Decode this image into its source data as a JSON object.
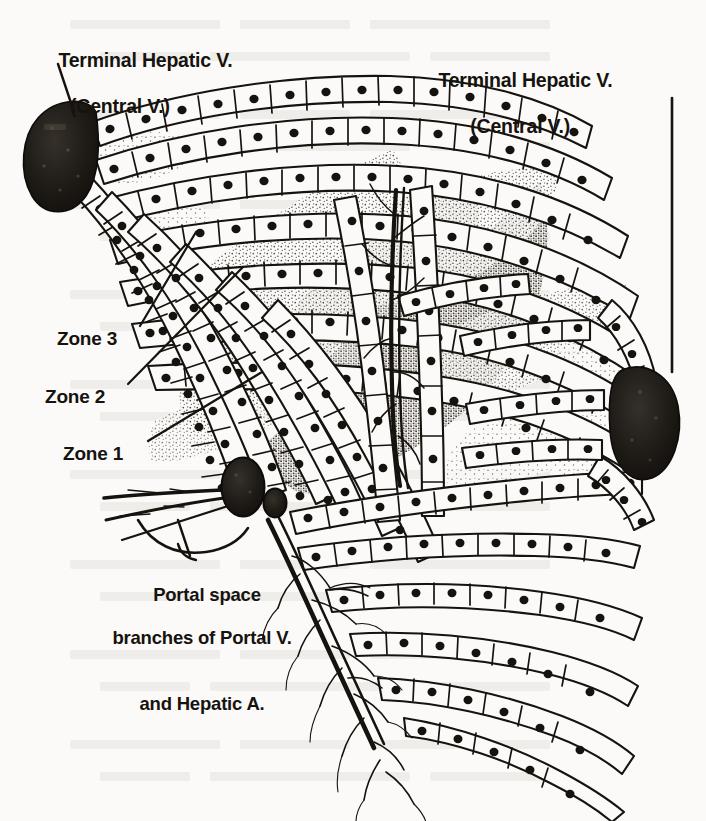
{
  "figure": {
    "type": "anatomical-line-diagram",
    "background_color": "#fbfaf8",
    "ink_color": "#16130f",
    "vessel_fill_color": "#1a1713",
    "stipple_color": "#3a332c"
  },
  "labels": {
    "terminal_hepatic_vein_left": {
      "line1": "Terminal Hepatic V.",
      "line2": "(Central V.)"
    },
    "terminal_hepatic_vein_right": {
      "line1": "Terminal Hepatic V.",
      "line2": "(Central V.)"
    },
    "zone3": "Zone 3",
    "zone2": "Zone 2",
    "zone1": "Zone 1",
    "portal_space": {
      "line1": "Portal space",
      "line2": "branches of Portal V.",
      "line3": "and Hepatic A."
    }
  },
  "structures": [
    {
      "name": "terminal-hepatic-venule-left",
      "shape": "dark-oval",
      "cx": 62,
      "cy": 146,
      "rx": 34,
      "ry": 44
    },
    {
      "name": "terminal-hepatic-venule-right",
      "shape": "dark-oval",
      "cx": 648,
      "cy": 418,
      "rx": 30,
      "ry": 54
    },
    {
      "name": "portal-vein-branch",
      "shape": "dark-oval",
      "cx": 243,
      "cy": 487,
      "rx": 21,
      "ry": 29
    },
    {
      "name": "hepatic-artery-branch",
      "shape": "dark-oval",
      "cx": 274,
      "cy": 502,
      "rx": 11,
      "ry": 14
    }
  ],
  "leaders": {
    "thv_left": {
      "type": "diagonal",
      "x1": 58,
      "y1": 64,
      "x2": 74,
      "y2": 112
    },
    "thv_right": {
      "type": "vertical",
      "x1": 672,
      "y1": 98,
      "x2": 672,
      "y2": 372
    },
    "zone3": {
      "type": "diagonal",
      "x1": 140,
      "y1": 326,
      "x2": 196,
      "y2": 232
    },
    "zone2": {
      "type": "diagonal",
      "x1": 128,
      "y1": 384,
      "x2": 243,
      "y2": 267
    },
    "zone1": {
      "type": "diagonal",
      "x1": 148,
      "y1": 441,
      "x2": 262,
      "y2": 372
    },
    "portal": {
      "type": "brace",
      "x1": 196,
      "y1": 556,
      "x2": 178,
      "y2": 519
    }
  }
}
